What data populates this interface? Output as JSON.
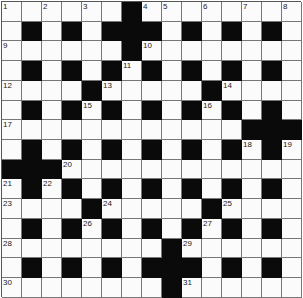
{
  "puzzle": {
    "rows": 15,
    "cols": 15,
    "grid": [
      "WWWWWWBWWWWWWWW",
      "WBWBWBBBWBWBWBW",
      "WWWWWWBWWWWWWWW",
      "WBWBWBWBWBWBWBW",
      "WWWWBWWWWWBWWWW",
      "WBWBWBWBWBWBWBW",
      "WWWWWWWWWWWWBBB",
      "WBWBWBWBWBWBWBW",
      "BBBWWWWWWWWWWWW",
      "WBWBWBWBWBWBWBW",
      "WWWWBWWWWWBWWWW",
      "WBWBWBWBWBWBWBW",
      "WWWWWWWWBWWWWWW",
      "WBWBWBWBBBWBWBW",
      "WWWWWWWWBWWWWWW"
    ],
    "numbers": [
      {
        "r": 0,
        "c": 0,
        "n": "1"
      },
      {
        "r": 0,
        "c": 2,
        "n": "2"
      },
      {
        "r": 0,
        "c": 4,
        "n": "3"
      },
      {
        "r": 0,
        "c": 7,
        "n": "4"
      },
      {
        "r": 0,
        "c": 8,
        "n": "5"
      },
      {
        "r": 0,
        "c": 10,
        "n": "6"
      },
      {
        "r": 0,
        "c": 12,
        "n": "7"
      },
      {
        "r": 0,
        "c": 14,
        "n": "8"
      },
      {
        "r": 2,
        "c": 0,
        "n": "9"
      },
      {
        "r": 2,
        "c": 7,
        "n": "10"
      },
      {
        "r": 3,
        "c": 6,
        "n": "11"
      },
      {
        "r": 4,
        "c": 0,
        "n": "12"
      },
      {
        "r": 4,
        "c": 5,
        "n": "13"
      },
      {
        "r": 4,
        "c": 11,
        "n": "14"
      },
      {
        "r": 5,
        "c": 4,
        "n": "15"
      },
      {
        "r": 5,
        "c": 10,
        "n": "16"
      },
      {
        "r": 6,
        "c": 0,
        "n": "17"
      },
      {
        "r": 7,
        "c": 12,
        "n": "18"
      },
      {
        "r": 7,
        "c": 14,
        "n": "19"
      },
      {
        "r": 8,
        "c": 3,
        "n": "20"
      },
      {
        "r": 9,
        "c": 0,
        "n": "21"
      },
      {
        "r": 9,
        "c": 2,
        "n": "22"
      },
      {
        "r": 10,
        "c": 0,
        "n": "23"
      },
      {
        "r": 10,
        "c": 5,
        "n": "24"
      },
      {
        "r": 10,
        "c": 11,
        "n": "25"
      },
      {
        "r": 11,
        "c": 4,
        "n": "26"
      },
      {
        "r": 11,
        "c": 10,
        "n": "27"
      },
      {
        "r": 12,
        "c": 0,
        "n": "28"
      },
      {
        "r": 12,
        "c": 9,
        "n": "29"
      },
      {
        "r": 14,
        "c": 0,
        "n": "30"
      },
      {
        "r": 14,
        "c": 9,
        "n": "31"
      }
    ]
  }
}
